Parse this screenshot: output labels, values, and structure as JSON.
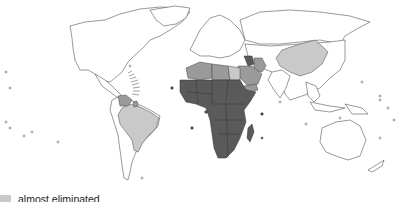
{
  "map": {
    "projection": "world-robinson-like",
    "categories": [
      {
        "key": "endemic",
        "color": "#5a5a5a"
      },
      {
        "key": "reduced",
        "color": "#9a9a9a"
      },
      {
        "key": "almost_eliminated",
        "color": "#c9c9c9"
      }
    ]
  },
  "legend": {
    "items": [
      {
        "label": "almost eliminated",
        "color": "#c9c9c9"
      }
    ]
  }
}
